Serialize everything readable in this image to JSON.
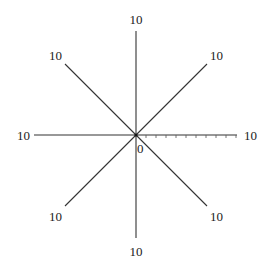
{
  "diagram": {
    "type": "radar-axes",
    "center": {
      "x": 136,
      "y": 135
    },
    "axis_length": 101,
    "axis_count": 8,
    "line_color": "#333333",
    "origin_label": "0",
    "axes": [
      {
        "name": "top",
        "angle": 90,
        "max_label": "10"
      },
      {
        "name": "top-right",
        "angle": 45,
        "max_label": "10"
      },
      {
        "name": "right",
        "angle": 0,
        "max_label": "10",
        "ticks": 10
      },
      {
        "name": "bottom-right",
        "angle": -45,
        "max_label": "10"
      },
      {
        "name": "bottom",
        "angle": -90,
        "max_label": "10"
      },
      {
        "name": "bottom-left",
        "angle": -135,
        "max_label": "10"
      },
      {
        "name": "left",
        "angle": 180,
        "max_label": "10"
      },
      {
        "name": "top-left",
        "angle": 135,
        "max_label": "10"
      }
    ]
  }
}
